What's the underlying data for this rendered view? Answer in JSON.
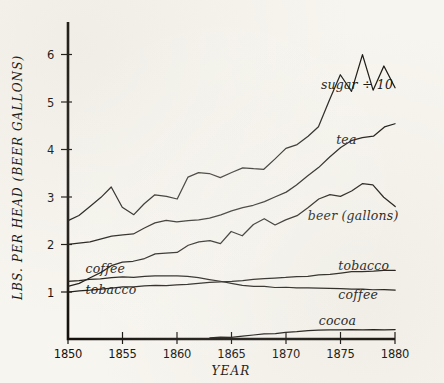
{
  "chart_data": {
    "type": "line",
    "title": "",
    "xlabel": "YEAR",
    "ylabel": "LBS. PER HEAD (BEER GALLONS)",
    "xlim": [
      1850,
      1880
    ],
    "ylim": [
      0,
      6.6
    ],
    "xticks": [
      1850,
      1855,
      1860,
      1865,
      1870,
      1875,
      1880
    ],
    "xtick_labels": [
      "1850",
      "1855",
      "1860",
      "1865",
      "1870",
      "1875",
      "1880"
    ],
    "yticks": [
      1,
      2,
      3,
      4,
      5,
      6
    ],
    "ytick_labels": [
      "1",
      "2",
      "3",
      "4",
      "5",
      "6"
    ],
    "grid": false,
    "legend": "inline-labels",
    "x": [
      1850,
      1851,
      1852,
      1853,
      1854,
      1855,
      1856,
      1857,
      1858,
      1859,
      1860,
      1861,
      1862,
      1863,
      1864,
      1865,
      1866,
      1867,
      1868,
      1869,
      1870,
      1871,
      1872,
      1873,
      1874,
      1875,
      1876,
      1877,
      1878,
      1879,
      1880
    ],
    "series": [
      {
        "name": "sugar ÷ 10",
        "label": "sugar ÷ 10",
        "label_x": 1873.2,
        "label_y": 5.28,
        "values": [
          2.5,
          2.62,
          2.8,
          3.0,
          3.22,
          2.78,
          2.62,
          2.85,
          3.05,
          3.02,
          2.95,
          3.42,
          3.52,
          3.5,
          3.4,
          3.52,
          3.62,
          3.6,
          3.58,
          3.8,
          4.02,
          4.1,
          4.28,
          4.48,
          5.05,
          5.58,
          5.22,
          6.0,
          5.25,
          5.75,
          5.3
        ]
      },
      {
        "name": "tea",
        "label": "tea",
        "label_x": 1874.6,
        "label_y": 4.12,
        "values": [
          2.0,
          2.02,
          2.05,
          2.12,
          2.18,
          2.2,
          2.22,
          2.35,
          2.45,
          2.5,
          2.48,
          2.5,
          2.52,
          2.55,
          2.62,
          2.7,
          2.78,
          2.82,
          2.9,
          3.0,
          3.1,
          3.25,
          3.45,
          3.62,
          3.85,
          4.05,
          4.18,
          4.25,
          4.28,
          4.48,
          4.55
        ]
      },
      {
        "name": "beer (gallons)",
        "label": "beer (gallons)",
        "label_x": 1872.0,
        "label_y": 2.52,
        "values": [
          1.12,
          1.18,
          1.3,
          1.42,
          1.55,
          1.62,
          1.65,
          1.7,
          1.8,
          1.82,
          1.84,
          1.98,
          2.05,
          2.08,
          2.02,
          2.28,
          2.18,
          2.42,
          2.55,
          2.42,
          2.52,
          2.6,
          2.78,
          2.95,
          3.05,
          3.02,
          3.12,
          3.28,
          3.25,
          3.0,
          2.8
        ]
      },
      {
        "name": "coffee",
        "label": "coffee",
        "label_left_x": 1851.6,
        "label_left_y": 1.4,
        "label_right_x": 1874.8,
        "label_right_y": 0.86,
        "values": [
          1.22,
          1.24,
          1.26,
          1.28,
          1.3,
          1.31,
          1.3,
          1.32,
          1.33,
          1.34,
          1.33,
          1.32,
          1.3,
          1.27,
          1.22,
          1.18,
          1.14,
          1.12,
          1.11,
          1.1,
          1.1,
          1.09,
          1.08,
          1.08,
          1.07,
          1.07,
          1.06,
          1.06,
          1.05,
          1.05,
          1.05
        ]
      },
      {
        "name": "tobacco",
        "label": "tobacco",
        "label_left_x": 1851.6,
        "label_left_y": 0.95,
        "label_right_x": 1874.8,
        "label_right_y": 1.47,
        "values": [
          1.0,
          1.02,
          1.04,
          1.07,
          1.09,
          1.1,
          1.1,
          1.12,
          1.13,
          1.14,
          1.15,
          1.16,
          1.18,
          1.2,
          1.22,
          1.22,
          1.24,
          1.26,
          1.28,
          1.29,
          1.3,
          1.32,
          1.34,
          1.36,
          1.38,
          1.4,
          1.42,
          1.43,
          1.44,
          1.45,
          1.46
        ]
      },
      {
        "name": "cocoa",
        "label": "cocoa",
        "label_x": 1873.0,
        "label_y": 0.3,
        "start_year": 1863,
        "values": [
          null,
          null,
          null,
          null,
          null,
          null,
          null,
          null,
          null,
          null,
          null,
          null,
          null,
          0.04,
          0.04,
          0.05,
          0.07,
          0.09,
          0.11,
          0.13,
          0.15,
          0.17,
          0.18,
          0.19,
          0.2,
          0.21,
          0.21,
          0.21,
          0.21,
          0.21,
          0.21
        ]
      }
    ]
  },
  "style": {
    "ink": "#15120e",
    "paper": "#f7f5ef"
  }
}
